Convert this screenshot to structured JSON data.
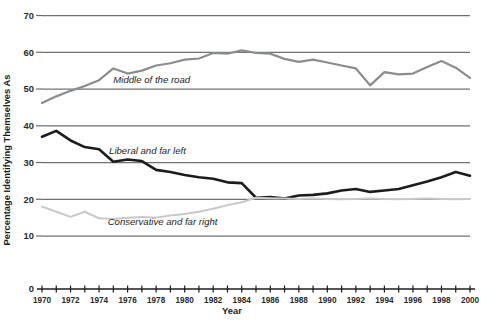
{
  "chart_data": {
    "type": "line",
    "title": "",
    "xlabel": "Year",
    "ylabel": "Percentage Identifying Themselves As",
    "xlim": [
      1970,
      2000
    ],
    "ylim": [
      0,
      70
    ],
    "ytick_labels": [
      "0",
      "10",
      "20",
      "30",
      "40",
      "50",
      "60",
      "70"
    ],
    "ytick_values": [
      0,
      10,
      20,
      30,
      40,
      50,
      60,
      70
    ],
    "gridlines": [
      10,
      20,
      30,
      40,
      50,
      60,
      70
    ],
    "grid": true,
    "legend_position": "inline-annotations",
    "x": [
      1970,
      1971,
      1972,
      1973,
      1974,
      1975,
      1976,
      1977,
      1978,
      1979,
      1980,
      1981,
      1982,
      1983,
      1984,
      1985,
      1986,
      1987,
      1988,
      1989,
      1990,
      1991,
      1992,
      1993,
      1994,
      1995,
      1996,
      1997,
      1998,
      1999,
      2000
    ],
    "xtick_labels": [
      "1970",
      "1972",
      "1974",
      "1976",
      "1978",
      "1980",
      "1982",
      "1984",
      "1986",
      "1988",
      "1990",
      "1992",
      "1994",
      "1996",
      "1998",
      "2000"
    ],
    "xtick_values": [
      1970,
      1972,
      1974,
      1976,
      1978,
      1980,
      1982,
      1984,
      1986,
      1988,
      1990,
      1992,
      1994,
      1996,
      1998,
      2000
    ],
    "series": [
      {
        "name": "Middle of the road",
        "annotation": "Middle of the road",
        "color": "#8a8d90",
        "width": 2.2,
        "values": [
          46.2,
          48.0,
          49.5,
          50.8,
          52.4,
          55.6,
          54.2,
          55.0,
          56.4,
          57.0,
          58.0,
          58.3,
          59.8,
          59.6,
          60.5,
          59.8,
          59.6,
          58.2,
          57.4,
          58.0,
          57.2,
          56.4,
          55.6,
          51.0,
          54.6,
          54.0,
          54.2,
          56.0,
          57.6,
          55.8,
          53.0
        ]
      },
      {
        "name": "Liberal and far left",
        "annotation": "Liberal and far left",
        "color": "#1c1c1c",
        "width": 2.6,
        "values": [
          37.0,
          38.6,
          36.0,
          34.2,
          33.6,
          30.2,
          30.8,
          30.4,
          28.0,
          27.4,
          26.6,
          26.0,
          25.6,
          24.6,
          24.4,
          20.4,
          20.6,
          20.2,
          21.0,
          21.2,
          21.6,
          22.4,
          22.8,
          22.0,
          22.4,
          22.8,
          23.8,
          24.8,
          26.0,
          27.4,
          26.4
        ]
      },
      {
        "name": "Conservative and far right",
        "annotation": "Conservative and far right",
        "color": "#c6c8ca",
        "width": 2.0,
        "values": [
          18.0,
          16.6,
          15.2,
          16.6,
          14.8,
          14.6,
          15.0,
          15.2,
          15.0,
          15.6,
          16.0,
          16.6,
          17.4,
          18.4,
          19.2,
          20.4,
          20.3,
          20.2,
          20.1,
          20.2,
          20.1,
          20.0,
          20.1,
          20.2,
          20.1,
          20.0,
          20.1,
          20.2,
          20.1,
          20.0,
          20.1
        ]
      }
    ],
    "annotation_positions": [
      {
        "label": "Middle of the road",
        "x": 1975.0,
        "y": 51.5
      },
      {
        "label": "Liberal and far left",
        "x": 1974.7,
        "y": 32.2
      },
      {
        "label": "Conservative and far right",
        "x": 1974.6,
        "y": 13.0
      }
    ]
  }
}
